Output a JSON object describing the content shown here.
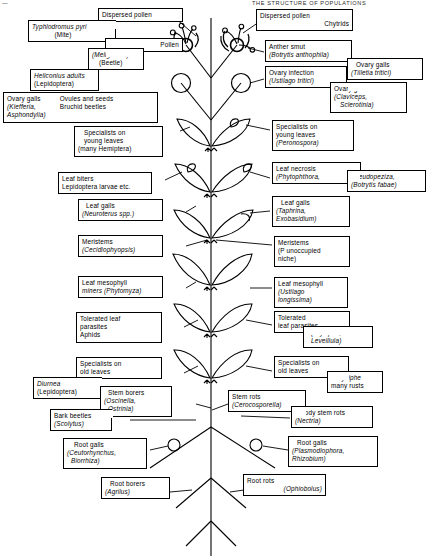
{
  "figure": {
    "title_fragment_left": "—",
    "title_fragment_right": "THE STRUCTURE OF POPULATIONS",
    "diagram_type": "plant-parasite-niche-diagram"
  },
  "plant": {
    "description": "Vertical stem with paired flowers at apex, two ovaries, five pairs of leaves, and a branching root system",
    "parts": [
      "flower-left",
      "flower-right",
      "ovary-left",
      "ovary-right",
      "leaf-pair-1",
      "leaf-pair-2",
      "leaf-pair-3",
      "leaf-pair-4",
      "leaf-pair-5",
      "stem",
      "root-nodule-left",
      "root-nodule-right",
      "root-system"
    ]
  },
  "labels": {
    "left": [
      {
        "id": "typhlodromus",
        "lines": [
          {
            "text": "Typhlodromus pyri",
            "italic": true
          },
          {
            "text": "(Mite)",
            "italic": false
          }
        ]
      },
      {
        "id": "dispersed-pollen-left",
        "lines": [
          {
            "text": "Dispersed pollen",
            "italic": false
          }
        ]
      },
      {
        "id": "pollen",
        "lines": [
          {
            "text": "Pollen",
            "italic": false
          }
        ]
      },
      {
        "id": "meligethes",
        "lines": [
          {
            "text": "(Meligethes)",
            "italic": true
          },
          {
            "text": "(Beetle)",
            "italic": false
          }
        ]
      },
      {
        "id": "heliconius",
        "lines": [
          {
            "text": "Heliconius adults",
            "italic": true
          },
          {
            "text": "(Lepidoptera)",
            "italic": false
          }
        ]
      },
      {
        "id": "ovary-galls-left",
        "col1": [
          {
            "text": "Ovary galls",
            "italic": false
          },
          {
            "text": "(Kiefferia,",
            "italic": true
          },
          {
            "text": "Asphondylia)",
            "italic": true
          }
        ],
        "col2": [
          {
            "text": "Ovules and seeds",
            "italic": false
          },
          {
            "text": "Bruchid beetles",
            "italic": false
          }
        ]
      },
      {
        "id": "specialists-young-leaves-left",
        "lines": [
          {
            "text": "Specialists on",
            "italic": false
          },
          {
            "text": "young leaves",
            "italic": false
          },
          {
            "text": "(many Hemiptera)",
            "italic": false
          }
        ]
      },
      {
        "id": "leaf-biters",
        "lines": [
          {
            "text": "Leaf biters",
            "italic": false
          },
          {
            "text": "Lepidoptera larvae etc.",
            "italic": false
          }
        ]
      },
      {
        "id": "leaf-galls-left",
        "lines": [
          {
            "text": "Leaf galls",
            "italic": false
          },
          {
            "text": "(Neuroterus spp.)",
            "italic": true
          }
        ]
      },
      {
        "id": "meristems-left",
        "lines": [
          {
            "text": "Meristems",
            "italic": false
          },
          {
            "text": "(Cecidiophyopsis)",
            "italic": true
          }
        ]
      },
      {
        "id": "leaf-mesophyll-miners",
        "lines": [
          {
            "text": "Leaf mesophyll",
            "italic": false
          },
          {
            "text": "miners (Phytomyza)",
            "italic": true
          }
        ]
      },
      {
        "id": "tolerated-leaf-parasites-left",
        "lines": [
          {
            "text": "Tolerated leaf",
            "italic": false
          },
          {
            "text": "parasites",
            "italic": false
          },
          {
            "text": "Aphids",
            "italic": false
          }
        ]
      },
      {
        "id": "specialists-old-leaves-left",
        "lines": [
          {
            "text": "Specialists on",
            "italic": false
          },
          {
            "text": "old leaves",
            "italic": false
          }
        ]
      },
      {
        "id": "diurnea",
        "lines": [
          {
            "text": "Diurnea",
            "italic": true
          },
          {
            "text": "(Lepidoptera)",
            "italic": false
          }
        ]
      },
      {
        "id": "stem-borers",
        "lines": [
          {
            "text": "Stem borers",
            "italic": false
          },
          {
            "text": "(Oscinella,",
            "italic": true
          },
          {
            "text": "Ostrinia)",
            "italic": true
          }
        ]
      },
      {
        "id": "bark-beetles",
        "lines": [
          {
            "text": "Bark beetles",
            "italic": false
          },
          {
            "text": "(Scolytus)",
            "italic": true
          }
        ]
      },
      {
        "id": "root-galls-left",
        "lines": [
          {
            "text": "Root galls",
            "italic": false
          },
          {
            "text": "(Ceutorhynchus,",
            "italic": true
          },
          {
            "text": "Biorrhiza)",
            "italic": true
          }
        ]
      },
      {
        "id": "root-borers",
        "lines": [
          {
            "text": "Root borers",
            "italic": false
          },
          {
            "text": "(Agrilus)",
            "italic": true
          }
        ]
      }
    ],
    "right": [
      {
        "id": "dispersed-pollen-right",
        "lines": [
          {
            "text": "Dispersed pollen",
            "italic": false
          }
        ]
      },
      {
        "id": "chytrids",
        "lines": [
          {
            "text": "Chytrids",
            "italic": false
          }
        ]
      },
      {
        "id": "anther-smut",
        "lines": [
          {
            "text": "Anther smut",
            "italic": false
          },
          {
            "text": "(Botrytis anthophila)",
            "italic": true
          }
        ]
      },
      {
        "id": "ovary-infection",
        "lines": [
          {
            "text": "Ovary infection",
            "italic": false
          },
          {
            "text": "(Ustilago tritici)",
            "italic": true
          }
        ]
      },
      {
        "id": "ovary-galls-tilletia",
        "lines": [
          {
            "text": "Ovary galls",
            "italic": false
          },
          {
            "text": "(Tilletia tritici)",
            "italic": true
          }
        ]
      },
      {
        "id": "ovary-galls-claviceps",
        "lines": [
          {
            "text": "Ovary galls",
            "italic": false
          },
          {
            "text": "(Claviceps,",
            "italic": true
          },
          {
            "text": "Sclerotinia)",
            "italic": true
          }
        ]
      },
      {
        "id": "specialists-young-leaves-right",
        "lines": [
          {
            "text": "Specialists on",
            "italic": false
          },
          {
            "text": "young leaves",
            "italic": false
          },
          {
            "text": "(Peronospora)",
            "italic": true
          }
        ]
      },
      {
        "id": "leaf-necrosis",
        "lines": [
          {
            "text": "Leaf necrosis",
            "italic": false
          },
          {
            "text": "(Phytophthora,",
            "italic": true
          }
        ],
        "extra_lines": [
          {
            "text": "Pseudopeziza,",
            "italic": true
          },
          {
            "text": "(Botrytis fabae)",
            "italic": true
          }
        ]
      },
      {
        "id": "leaf-galls-right",
        "lines": [
          {
            "text": "Leaf galls",
            "italic": false
          },
          {
            "text": "(Taphrina,",
            "italic": true
          },
          {
            "text": "Exobasidium)",
            "italic": true
          }
        ]
      },
      {
        "id": "meristems-right",
        "lines": [
          {
            "text": "Meristems",
            "italic": false
          },
          {
            "text": "(P unoccupied",
            "italic": false
          },
          {
            "text": "niche)",
            "italic": false
          }
        ]
      },
      {
        "id": "leaf-mesophyll-right",
        "lines": [
          {
            "text": "Leaf mesophyll",
            "italic": false
          },
          {
            "text": "(Ustilago",
            "italic": true
          },
          {
            "text": "longissima)",
            "italic": true
          }
        ]
      },
      {
        "id": "tolerated-leaf-parasites-right",
        "lines": [
          {
            "text": "Tolerated",
            "italic": false
          },
          {
            "text": "leaf parasites",
            "italic": false
          }
        ],
        "extra_lines": [
          {
            "text": "(Erysiphe,",
            "italic": true
          },
          {
            "text": "Leveillula)",
            "italic": true
          }
        ]
      },
      {
        "id": "specialists-old-leaves-right",
        "lines": [
          {
            "text": "Specialists on",
            "italic": false
          },
          {
            "text": "old leaves",
            "italic": false
          }
        ],
        "extra_lines": [
          {
            "text": "Erysiphe",
            "italic": true
          },
          {
            "text": "many rusts",
            "italic": false
          }
        ]
      },
      {
        "id": "stem-rots",
        "lines": [
          {
            "text": "Stem rots",
            "italic": false
          },
          {
            "text": "(Cerocosporella)",
            "italic": true
          }
        ]
      },
      {
        "id": "woody-stem-rots",
        "lines": [
          {
            "text": "Woody stem rots",
            "italic": false
          },
          {
            "text": "(Nectria)",
            "italic": true
          }
        ]
      },
      {
        "id": "root-galls-right",
        "lines": [
          {
            "text": "Root galls",
            "italic": false
          },
          {
            "text": "(Plasmodiophora,",
            "italic": true
          },
          {
            "text": "Rhizobium)",
            "italic": true
          }
        ]
      },
      {
        "id": "root-rots",
        "lines": [
          {
            "text": "Root rots",
            "italic": false
          },
          {
            "text": "(Ophiobolus)",
            "italic": true
          }
        ]
      }
    ]
  },
  "colors": {
    "ink": "#000000",
    "paper": "#ffffff"
  }
}
